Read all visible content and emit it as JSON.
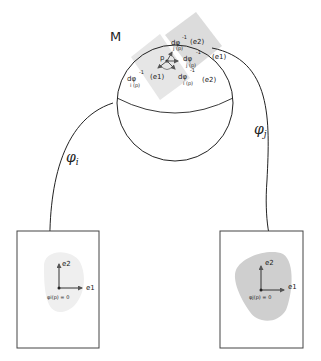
{
  "figure": {
    "manifold_label": "M",
    "point_label": "p",
    "maps": [
      {
        "id": "i",
        "label": "φi",
        "symbol": "φ",
        "subscript": "i"
      },
      {
        "id": "j",
        "label": "φj",
        "symbol": "φ",
        "subscript": "j"
      }
    ],
    "tangent_labels": {
      "top": {
        "d": "dφ",
        "sup": "-1",
        "sub": "j (p)",
        "arg": "(e2)"
      },
      "right_upper": {
        "d": "dφ",
        "sup": "-1",
        "sub": "j (p)",
        "arg": "(e1)"
      },
      "left": {
        "d": "dφ",
        "sup": "-1",
        "sub": "i (p)",
        "arg": "(e1)"
      },
      "right_lower": {
        "d": "dφ",
        "sup": "-1",
        "sub": "i (p)",
        "arg": "(e2)"
      }
    },
    "charts": [
      {
        "id": "left-chart",
        "axis_x_label": "e1",
        "axis_y_label": "e2",
        "origin_label": "φi(p) = 0",
        "region_color": "#efefef"
      },
      {
        "id": "right-chart",
        "axis_x_label": "e1",
        "axis_y_label": "e2",
        "origin_label": "φj(p) = 0",
        "region_color": "#cfcfcf"
      }
    ],
    "colors": {
      "stroke": "#222222",
      "patch_light": "#e6e6e6",
      "patch_dark": "#d2d2d2",
      "box_border": "#444444"
    }
  }
}
